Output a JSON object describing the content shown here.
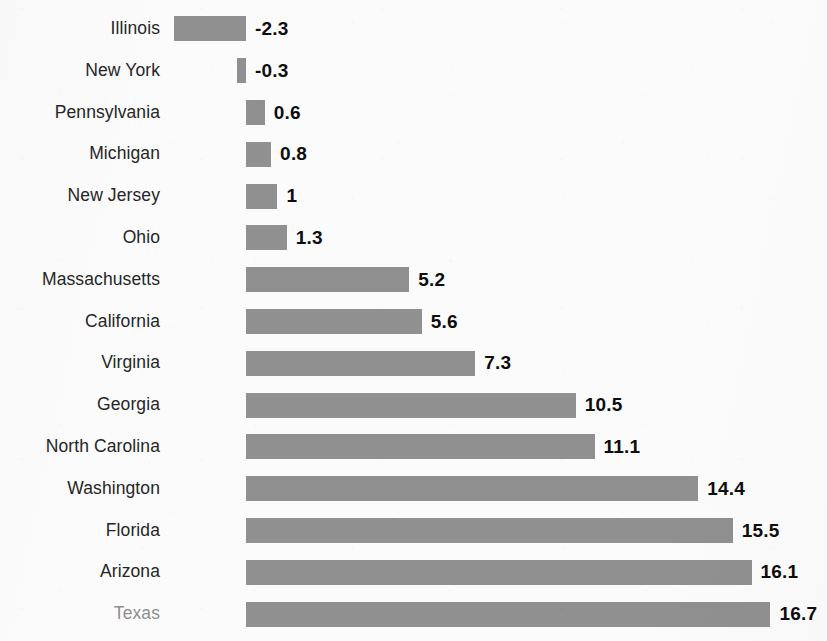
{
  "chart_data": {
    "type": "bar",
    "orientation": "horizontal",
    "title": "",
    "subtitle": "",
    "xlabel": "",
    "ylabel": "",
    "grid": false,
    "legend": null,
    "axis_visible": false,
    "tick_labels_visible": false,
    "value_labels_visible": true,
    "baseline_value": 0,
    "xlim": [
      -2.3,
      16.7
    ],
    "categories": [
      "Illinois",
      "New York",
      "Pennsylvania",
      "Michigan",
      "New Jersey",
      "Ohio",
      "Massachusetts",
      "California",
      "Virginia",
      "Georgia",
      "North Carolina",
      "Washington",
      "Florida",
      "Arizona",
      "Texas"
    ],
    "values": [
      -2.3,
      -0.3,
      0.6,
      0.8,
      1,
      1.3,
      5.2,
      5.6,
      7.3,
      10.5,
      11.1,
      14.4,
      15.5,
      16.1,
      16.7
    ],
    "value_labels": [
      "-2.3",
      "-0.3",
      "0.6",
      "0.8",
      "1",
      "1.3",
      "5.2",
      "5.6",
      "7.3",
      "10.5",
      "11.1",
      "14.4",
      "15.5",
      "16.1",
      "16.7"
    ],
    "highlighted_category": "Texas",
    "series": [
      {
        "name": "value",
        "values": [
          -2.3,
          -0.3,
          0.6,
          0.8,
          1,
          1.3,
          5.2,
          5.6,
          7.3,
          10.5,
          11.1,
          14.4,
          15.5,
          16.1,
          16.7
        ]
      }
    ]
  },
  "style": {
    "bar_color": "#909090",
    "background_color": "#fbfbfb",
    "label_color": "#262626",
    "highlight_label_color": "#8f8f8f",
    "value_label_color": "#0d0d0d"
  },
  "geometry": {
    "baseline_x": 246,
    "px_per_unit": 31.4,
    "row_pitch": 41.8,
    "first_row_center": 29,
    "bar_height": 25,
    "label_right_x": 160,
    "value_gap": 9
  }
}
